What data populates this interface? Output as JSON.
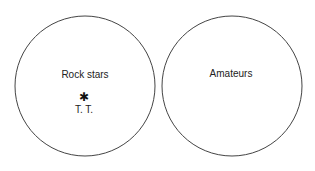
{
  "diagram": {
    "type": "set-diagram",
    "sets": [
      {
        "label": "Rock stars",
        "members": [
          {
            "marker": "✱",
            "label": "T. T."
          }
        ]
      },
      {
        "label": "Amateurs",
        "members": []
      }
    ],
    "stroke_color": "#444444"
  }
}
